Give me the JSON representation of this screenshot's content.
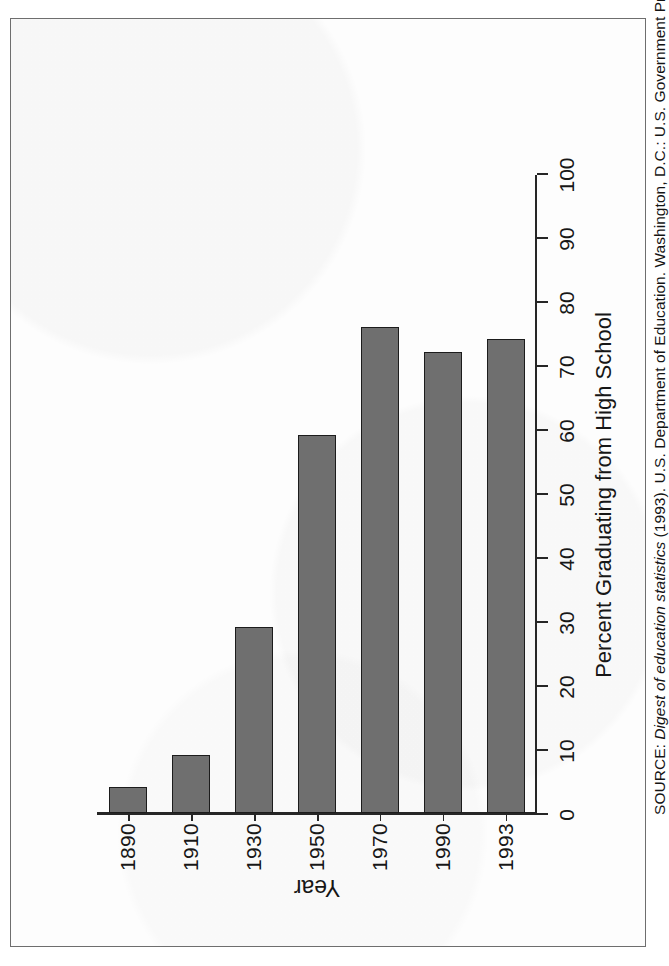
{
  "figure": {
    "source_note_prefix": "SOURCE: ",
    "source_note_italic": "Digest of education statistics",
    "source_note_rest": " (1993). U.S. Department of Education. Washington, D.C.: U.S. Government Printing Office."
  },
  "chart_data": {
    "type": "bar",
    "orientation": "vertical-printed-sideways",
    "title": "",
    "categories": [
      "1890",
      "1910",
      "1930",
      "1950",
      "1970",
      "1990",
      "1993"
    ],
    "values": [
      4,
      9,
      29,
      59,
      76,
      72,
      74
    ],
    "series": [
      {
        "name": "Percent Graduating from High School",
        "values": [
          4,
          9,
          29,
          59,
          76,
          72,
          74
        ]
      }
    ],
    "xlabel": "Year",
    "ylabel": "Percent Graduating from High School",
    "ylim": [
      0,
      100
    ],
    "ytick_labels": [
      "0",
      "10",
      "20",
      "30",
      "40",
      "50",
      "60",
      "70",
      "80",
      "90",
      "100"
    ],
    "ytick_values": [
      0,
      10,
      20,
      30,
      40,
      50,
      60,
      70,
      80,
      90,
      100
    ],
    "grid": false,
    "legend": false,
    "legend_position": "none",
    "bar_fill_color": "#6f6f6f",
    "bar_edge_color": "#1c1c1c",
    "axis_color": "#262626",
    "background_color": "#fdfdfd"
  }
}
